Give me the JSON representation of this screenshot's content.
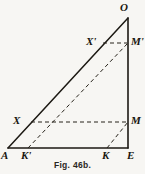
{
  "figure": {
    "caption": "Fig. 46b.",
    "stroke_color": "#1c1913",
    "background_color": "#f7f6f3",
    "canvas": {
      "width": 145,
      "height": 174
    },
    "points": {
      "A": {
        "label": "A",
        "x": 8,
        "y": 148
      },
      "E": {
        "label": "E",
        "x": 128,
        "y": 148
      },
      "O": {
        "label": "O",
        "x": 128,
        "y": 18
      },
      "M": {
        "label": "M",
        "x": 128,
        "y": 122
      },
      "M_prime": {
        "label": "M'",
        "x": 128,
        "y": 43
      },
      "X": {
        "label": "X",
        "x": 32,
        "y": 122
      },
      "X_prime": {
        "label": "X'",
        "x": 105,
        "y": 43
      },
      "K": {
        "label": "K",
        "x": 107,
        "y": 148
      },
      "K_prime": {
        "label": "K'",
        "x": 28,
        "y": 148
      }
    },
    "label_positions": {
      "O": {
        "x": 120,
        "y": 2
      },
      "E": {
        "x": 127,
        "y": 150
      },
      "A": {
        "x": 1,
        "y": 150
      },
      "M": {
        "x": 131,
        "y": 115
      },
      "M_prime": {
        "x": 131,
        "y": 36
      },
      "X": {
        "x": 13,
        "y": 115
      },
      "X_prime": {
        "x": 86,
        "y": 36
      },
      "K": {
        "x": 102,
        "y": 150
      },
      "K_prime": {
        "x": 21,
        "y": 150
      }
    },
    "segments": [
      {
        "name": "base-A-E",
        "from": "A",
        "to": "E",
        "style": "solid"
      },
      {
        "name": "vertical-E-O",
        "from": "E",
        "to": "O",
        "style": "solid"
      },
      {
        "name": "hypotenuse-A-O",
        "from": "A",
        "to": "O",
        "style": "solid"
      },
      {
        "name": "dashed-X-M",
        "from": "X",
        "to": "M",
        "style": "dashed"
      },
      {
        "name": "dashed-Xp-Mp",
        "from": "X_prime",
        "to": "M_prime",
        "style": "dashed"
      },
      {
        "name": "dashed-Kp-Mp",
        "from": "K_prime",
        "to": "M_prime",
        "style": "dashed"
      },
      {
        "name": "dashed-K-M",
        "from": "K",
        "to": "M",
        "style": "dashed"
      }
    ]
  }
}
